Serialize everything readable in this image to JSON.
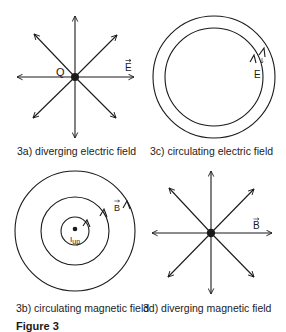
{
  "figure": {
    "title": "Figure 3",
    "panels": [
      {
        "id": "3a",
        "caption": "3a) diverging electric field",
        "type": "diverging",
        "charge_label": "Q",
        "field_label": "E",
        "field_symbol": "E-vector"
      },
      {
        "id": "3c",
        "caption": "3c) circulating electric field",
        "type": "circulating",
        "field_label": "E",
        "field_symbol": "E-vector"
      },
      {
        "id": "3b",
        "caption": "3b) circulating magnetic field",
        "type": "circulating",
        "current_label": "I",
        "current_subscript": "up",
        "field_label": "B",
        "field_symbol": "B-vector"
      },
      {
        "id": "3d",
        "caption": "3d) diverging magnetic field",
        "type": "diverging",
        "field_label": "B",
        "field_symbol": "B-vector"
      }
    ]
  },
  "colors": {
    "line": "#1a1a1a",
    "background": "#ffffff"
  }
}
